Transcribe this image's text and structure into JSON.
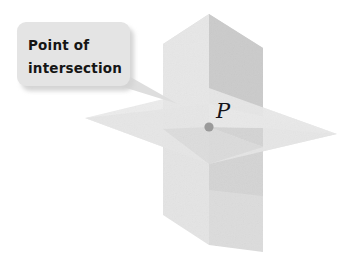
{
  "figure": {
    "background_color": "#ffffff",
    "width": 354,
    "height": 255
  },
  "callout": {
    "line1": "Point of",
    "line2": "intersection",
    "box_fill": "#e3e3e3",
    "text_color": "#151515",
    "shadow_color": "#d2d2d2"
  },
  "point": {
    "label": "P",
    "dot_color": "#9a9a9a",
    "label_color": "#15151a",
    "x": 209,
    "y": 127
  },
  "planes": {
    "horizontal_label": "horizontal plane",
    "vertical_left_label": "left vertical plane",
    "vertical_right_label": "right vertical plane",
    "fill_light": "#ececec",
    "fill_mid": "#e0e0e0",
    "fill_dark": "#cfcfcf",
    "fill_darkest": "#c2c2c2"
  }
}
